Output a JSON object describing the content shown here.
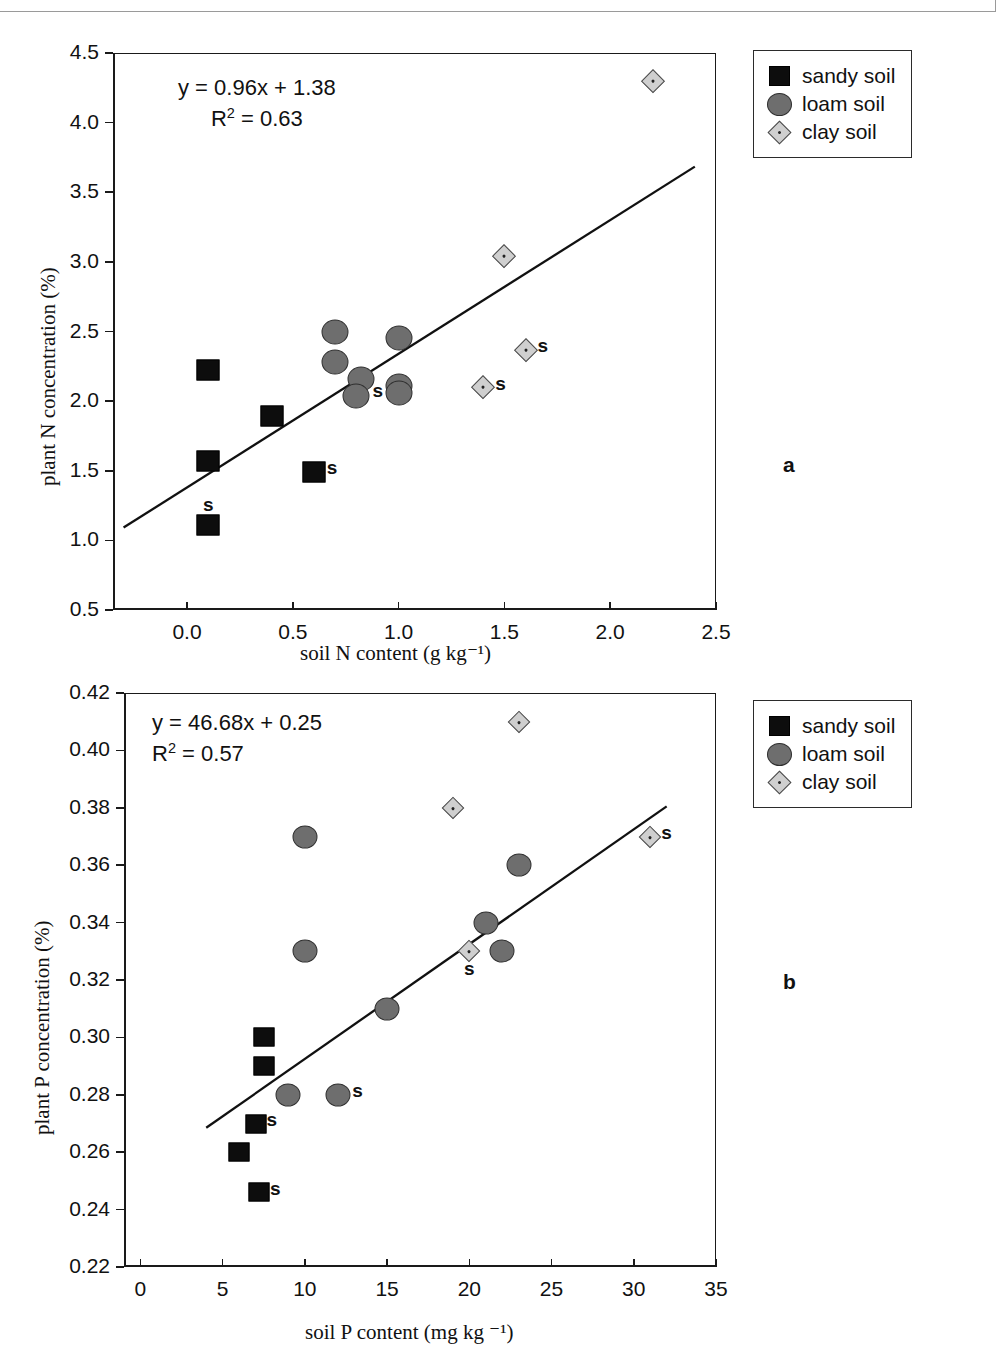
{
  "figure": {
    "panels": [
      {
        "label": "a",
        "label_x": 783,
        "label_y": 465
      },
      {
        "label": "b",
        "label_x": 783,
        "label_y": 981
      }
    ]
  },
  "legend": {
    "items": [
      {
        "label": "sandy soil",
        "marker": "square",
        "color": "#0d0d0d"
      },
      {
        "label": "loam soil",
        "marker": "circle",
        "color": "#6e6e6e"
      },
      {
        "label": "clay soil",
        "marker": "diamond",
        "color": "#cfcfcf"
      }
    ]
  },
  "chart_data": [
    {
      "type": "scatter",
      "panel": "a",
      "title": "",
      "xlabel": "soil N content (g kg⁻¹)",
      "ylabel": "plant N concentration (%)",
      "xlim": [
        -0.35,
        2.5
      ],
      "ylim": [
        0.5,
        4.5
      ],
      "xticks": [
        0.0,
        0.5,
        1.0,
        1.5,
        2.0,
        2.5
      ],
      "xticklabels": [
        "0.0",
        "0.5",
        "1.0",
        "1.5",
        "2.0",
        "2.5"
      ],
      "yticks": [
        0.5,
        1.0,
        1.5,
        2.0,
        2.5,
        3.0,
        3.5,
        4.0,
        4.5
      ],
      "yticklabels": [
        "0.5",
        "1.0",
        "1.5",
        "2.0",
        "2.5",
        "3.0",
        "3.5",
        "4.0",
        "4.5"
      ],
      "grid": false,
      "legend_position": "outside-top-right",
      "annotation_equation": "y = 0.96x + 1.38",
      "annotation_r2_prefix": "R",
      "annotation_r2_exp": "2",
      "annotation_r2_value": " = 0.63",
      "fit": {
        "slope": 0.96,
        "intercept": 1.38,
        "r2": 0.63,
        "x_start": -0.3,
        "x_end": 2.4
      },
      "series": [
        {
          "name": "sandy soil",
          "marker": "square",
          "points": [
            {
              "x": 0.1,
              "y": 2.22,
              "s": false
            },
            {
              "x": 0.4,
              "y": 1.89,
              "s": false
            },
            {
              "x": 0.1,
              "y": 1.57,
              "s": false
            },
            {
              "x": 0.6,
              "y": 1.49,
              "s": true
            },
            {
              "x": 0.1,
              "y": 1.11,
              "s": true,
              "s_above": true
            }
          ]
        },
        {
          "name": "loam soil",
          "marker": "circle",
          "points": [
            {
              "x": 0.7,
              "y": 2.5,
              "s": false
            },
            {
              "x": 1.0,
              "y": 2.45,
              "s": false
            },
            {
              "x": 0.7,
              "y": 2.28,
              "s": false
            },
            {
              "x": 0.82,
              "y": 2.16,
              "s": false
            },
            {
              "x": 1.0,
              "y": 2.11,
              "s": false
            },
            {
              "x": 1.0,
              "y": 2.06,
              "s": false
            },
            {
              "x": 0.8,
              "y": 2.04,
              "s": true
            }
          ]
        },
        {
          "name": "clay soil",
          "marker": "diamond",
          "points": [
            {
              "x": 2.2,
              "y": 4.3,
              "s": false
            },
            {
              "x": 1.5,
              "y": 3.04,
              "s": false
            },
            {
              "x": 1.6,
              "y": 2.37,
              "s": true
            },
            {
              "x": 1.4,
              "y": 2.1,
              "s": true
            }
          ]
        }
      ]
    },
    {
      "type": "scatter",
      "panel": "b",
      "title": "",
      "xlabel": "soil P content (mg kg ⁻¹)",
      "ylabel": "plant P concentration (%)",
      "xlim": [
        -1.0,
        35.0
      ],
      "ylim": [
        0.22,
        0.42
      ],
      "xticks": [
        0,
        5,
        10,
        15,
        20,
        25,
        30,
        35
      ],
      "xticklabels": [
        "0",
        "5",
        "10",
        "15",
        "20",
        "25",
        "30",
        "35"
      ],
      "yticks": [
        0.22,
        0.24,
        0.26,
        0.28,
        0.3,
        0.32,
        0.34,
        0.36,
        0.38,
        0.4,
        0.42
      ],
      "yticklabels": [
        "0.22",
        "0.24",
        "0.26",
        "0.28",
        "0.30",
        "0.32",
        "0.34",
        "0.36",
        "0.38",
        "0.40",
        "0.42"
      ],
      "grid": false,
      "legend_position": "outside-top-right",
      "annotation_equation": "y = 46.68x + 0.25",
      "annotation_r2_prefix": "R",
      "annotation_r2_exp": "2",
      "annotation_r2_value": " = 0.57",
      "fit": {
        "slope": 0.004,
        "intercept": 0.2525,
        "r2": 0.57,
        "x_start": 4.0,
        "x_end": 32.0
      },
      "series": [
        {
          "name": "sandy soil",
          "marker": "square",
          "points": [
            {
              "x": 7.5,
              "y": 0.3,
              "s": false
            },
            {
              "x": 7.5,
              "y": 0.29,
              "s": false
            },
            {
              "x": 7.0,
              "y": 0.27,
              "s": true
            },
            {
              "x": 6.0,
              "y": 0.26,
              "s": false
            },
            {
              "x": 7.2,
              "y": 0.246,
              "s": true
            }
          ]
        },
        {
          "name": "loam soil",
          "marker": "circle",
          "points": [
            {
              "x": 23.0,
              "y": 0.36,
              "s": false
            },
            {
              "x": 10.0,
              "y": 0.37,
              "s": false
            },
            {
              "x": 21.0,
              "y": 0.34,
              "s": false
            },
            {
              "x": 10.0,
              "y": 0.33,
              "s": false
            },
            {
              "x": 22.0,
              "y": 0.33,
              "s": false
            },
            {
              "x": 15.0,
              "y": 0.31,
              "s": false
            },
            {
              "x": 9.0,
              "y": 0.28,
              "s": false
            },
            {
              "x": 12.0,
              "y": 0.28,
              "s": true
            }
          ]
        },
        {
          "name": "clay soil",
          "marker": "diamond",
          "points": [
            {
              "x": 23.0,
              "y": 0.41,
              "s": false
            },
            {
              "x": 19.0,
              "y": 0.38,
              "s": false
            },
            {
              "x": 31.0,
              "y": 0.37,
              "s": true
            },
            {
              "x": 20.0,
              "y": 0.33,
              "s": true,
              "s_below": true
            }
          ]
        }
      ]
    }
  ]
}
